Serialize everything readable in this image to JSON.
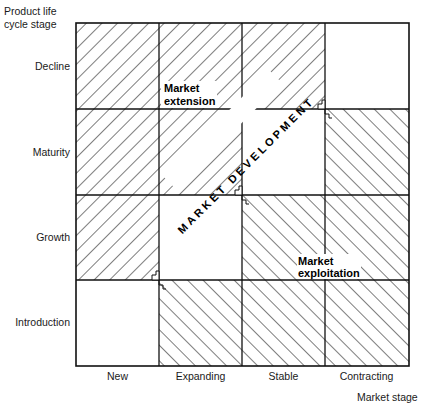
{
  "diagram": {
    "y_axis_title": [
      "Product life",
      "cycle stage"
    ],
    "x_axis_title": "Market stage",
    "rows": [
      "Decline",
      "Maturity",
      "Growth",
      "Introduction"
    ],
    "columns": [
      "New",
      "Expanding",
      "Stable",
      "Contracting"
    ],
    "regions": {
      "extension": {
        "label_line1": "Market",
        "label_line2": "extension",
        "hatch": "backslash",
        "cells": [
          [
            "Decline",
            "New"
          ],
          [
            "Decline",
            "Expanding"
          ],
          [
            "Decline",
            "Stable"
          ],
          [
            "Maturity",
            "New"
          ],
          [
            "Maturity",
            "Expanding"
          ],
          [
            "Growth",
            "New"
          ]
        ]
      },
      "development": {
        "label": "MARKET DEVELOPMENT",
        "hatch": "none",
        "cells": [
          [
            "Decline",
            "Contracting"
          ],
          [
            "Maturity",
            "Stable"
          ],
          [
            "Growth",
            "Expanding"
          ],
          [
            "Introduction",
            "New"
          ]
        ]
      },
      "exploitation": {
        "label_line1": "Market",
        "label_line2": "exploitation",
        "hatch": "slash",
        "cells": [
          [
            "Maturity",
            "Contracting"
          ],
          [
            "Growth",
            "Stable"
          ],
          [
            "Growth",
            "Contracting"
          ],
          [
            "Introduction",
            "Expanding"
          ],
          [
            "Introduction",
            "Stable"
          ],
          [
            "Introduction",
            "Contracting"
          ]
        ]
      }
    },
    "colors": {
      "line": "#111111",
      "background": "#ffffff"
    }
  }
}
